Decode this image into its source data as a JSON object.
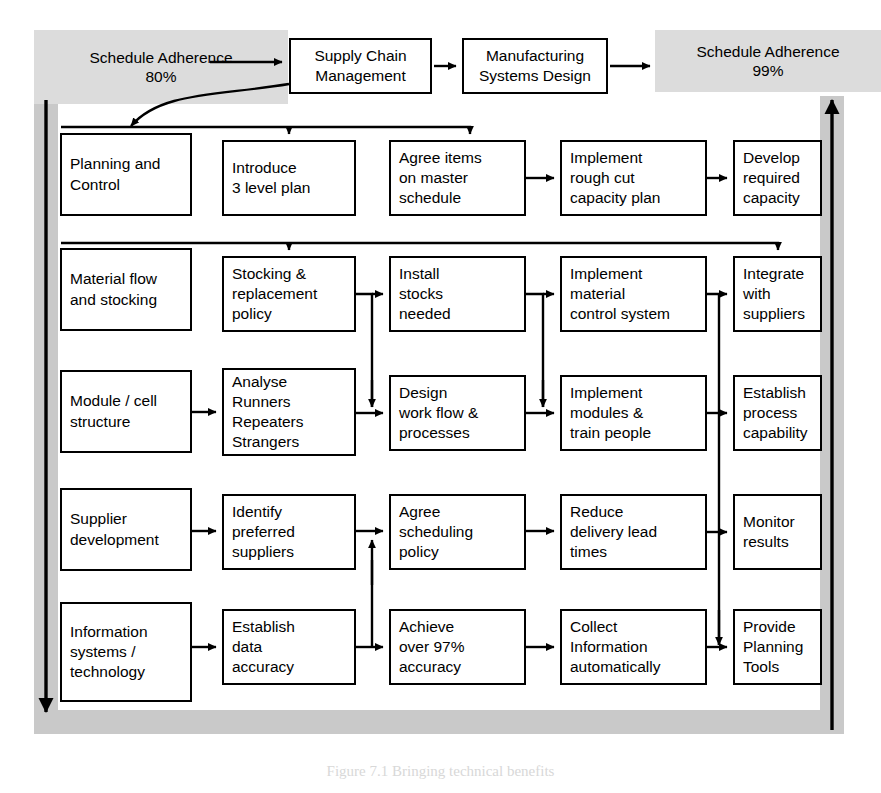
{
  "figure": {
    "caption": "Figure 7.1  Bringing technical benefits",
    "frame_color": "#c9c9c9",
    "box_border_color": "#000000",
    "chip_color": "#dcdcdc"
  },
  "header": {
    "left_chip": {
      "line1": "Schedule Adherence",
      "line2": "80%"
    },
    "right_chip": {
      "line1": "Schedule Adherence",
      "line2": "99%"
    },
    "stage1": {
      "line1": "Supply Chain",
      "line2": "Management"
    },
    "stage2": {
      "line1": "Manufacturing",
      "line2": "Systems Design"
    }
  },
  "side_arrows": {
    "left_label": "down-arrow",
    "right_label": "up-arrow"
  },
  "rows": [
    {
      "id": "planning-and-control",
      "theme": {
        "lines": [
          "Planning and",
          "Control"
        ]
      },
      "steps": [
        {
          "lines": [
            "Introduce",
            "3 level plan"
          ]
        },
        {
          "lines": [
            "Agree items",
            "on master",
            "schedule"
          ]
        },
        {
          "lines": [
            "Implement",
            "rough cut",
            "capacity plan"
          ]
        },
        {
          "lines": [
            "Develop",
            "required",
            "capacity"
          ]
        }
      ]
    },
    {
      "id": "material-flow-and-stocking",
      "theme": {
        "lines": [
          "Material flow",
          "and stocking"
        ]
      },
      "steps": [
        {
          "lines": [
            "Stocking &",
            "replacement",
            "policy"
          ]
        },
        {
          "lines": [
            "Install",
            "stocks",
            "needed"
          ]
        },
        {
          "lines": [
            "Implement",
            "material",
            "control system"
          ]
        },
        {
          "lines": [
            "Integrate",
            "with",
            "suppliers"
          ]
        }
      ]
    },
    {
      "id": "module-cell-structure",
      "theme": {
        "lines": [
          "Module / cell",
          "structure"
        ]
      },
      "steps": [
        {
          "lines": [
            "Analyse",
            "Runners",
            "Repeaters",
            "Strangers"
          ]
        },
        {
          "lines": [
            "Design",
            "work flow &",
            "processes"
          ]
        },
        {
          "lines": [
            "Implement",
            "modules &",
            "train people"
          ]
        },
        {
          "lines": [
            "Establish",
            "process",
            "capability"
          ]
        }
      ]
    },
    {
      "id": "supplier-development",
      "theme": {
        "lines": [
          "Supplier",
          "development"
        ]
      },
      "steps": [
        {
          "lines": [
            "Identify",
            "preferred",
            "suppliers"
          ]
        },
        {
          "lines": [
            "Agree",
            "scheduling",
            "policy"
          ]
        },
        {
          "lines": [
            "Reduce",
            "delivery lead",
            "times"
          ]
        },
        {
          "lines": [
            "Monitor",
            "results"
          ]
        }
      ]
    },
    {
      "id": "information-systems-technology",
      "theme": {
        "lines": [
          "Information",
          "systems /",
          "technology"
        ]
      },
      "steps": [
        {
          "lines": [
            "Establish",
            "data",
            "accuracy"
          ]
        },
        {
          "lines": [
            "Achieve",
            "over 97%",
            "accuracy"
          ]
        },
        {
          "lines": [
            "Collect",
            "Information",
            "automatically"
          ]
        },
        {
          "lines": [
            "Provide",
            "Planning",
            "Tools"
          ]
        }
      ]
    }
  ]
}
